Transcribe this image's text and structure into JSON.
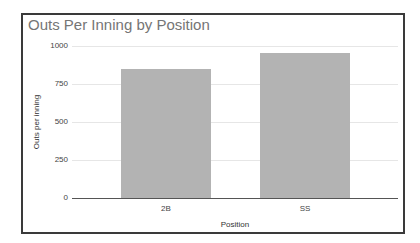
{
  "chart_data": {
    "type": "bar",
    "title": "Outs Per Inning by Position",
    "xlabel": "Position",
    "ylabel": "Outs per inning",
    "categories": [
      "2B",
      "SS"
    ],
    "values": [
      850,
      955
    ],
    "ylim": [
      0,
      1000
    ],
    "yticks": [
      "0",
      "250",
      "500",
      "750",
      "1000"
    ],
    "grid": true,
    "legend": "none",
    "bar_color": "#b3b3b3"
  }
}
